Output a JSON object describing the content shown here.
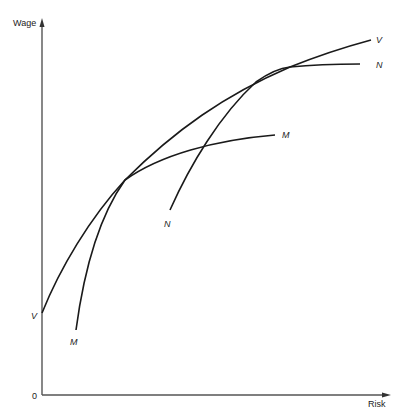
{
  "diagram": {
    "y_axis_label": "Wage",
    "x_axis_label": "Risk",
    "origin_label": "0",
    "curves": [
      {
        "name": "V",
        "start_label": "V",
        "end_label": "V",
        "description": "envelope / market wage-risk locus"
      },
      {
        "name": "M",
        "start_label": "M",
        "end_label": "M",
        "description": "firm offer curve tangent to V at lower risk"
      },
      {
        "name": "N",
        "start_label": "N",
        "end_label": "N",
        "description": "firm offer curve tangent to V at higher risk"
      }
    ],
    "colors": {
      "curve": "#1a1a1a",
      "axis": "#555555",
      "background": "#ffffff"
    }
  }
}
